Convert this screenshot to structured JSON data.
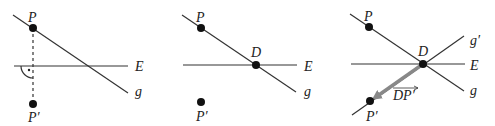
{
  "panels": [
    {
      "id": "panel-1",
      "labels": {
        "P": "P",
        "P_prime": "P′",
        "E": "E",
        "g": "g"
      },
      "description": "Point P on line g, perpendicular dropped to line E, mirror point P′"
    },
    {
      "id": "panel-2",
      "labels": {
        "P": "P",
        "P_prime": "P′",
        "D": "D",
        "E": "E",
        "g": "g"
      },
      "description": "Line g intersects E at D"
    },
    {
      "id": "panel-3",
      "labels": {
        "P": "P",
        "P_prime": "P′",
        "D": "D",
        "E": "E",
        "g": "g",
        "g_prime": "g′",
        "vector": "DP′"
      },
      "description": "Reflected line g′ through D and P′, vector DP′ shown",
      "colors": {
        "vector": "#888888"
      }
    }
  ],
  "colors": {
    "line": "#333333",
    "point": "#111111",
    "vector": "#888888",
    "dashed": "#333333"
  }
}
